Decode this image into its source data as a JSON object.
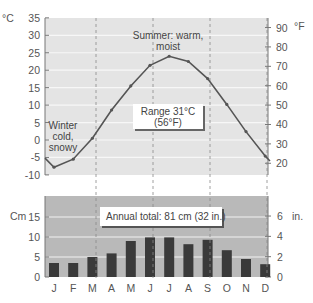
{
  "chart_data": [
    {
      "type": "line",
      "title": "Monthly mean temperature",
      "x": [
        "J",
        "F",
        "M",
        "A",
        "M",
        "J",
        "J",
        "A",
        "S",
        "O",
        "N",
        "D"
      ],
      "series": [
        {
          "name": "Temperature (°C)",
          "values": [
            -7.8,
            -5.5,
            0.5,
            8.6,
            15.5,
            21.4,
            24.0,
            22.5,
            17.6,
            10.2,
            2.4,
            -4.6
          ]
        }
      ],
      "ylabel": "°C",
      "ylabel_right": "°F",
      "ylim": [
        -10,
        35
      ],
      "yticks": [
        -10,
        -5,
        0,
        5,
        10,
        15,
        20,
        25,
        30,
        35
      ],
      "yticks_right": [
        20,
        30,
        40,
        50,
        60,
        70,
        80,
        90
      ],
      "grid": true,
      "annotations": [
        {
          "text": "Summer: warm,",
          "text2": "moist"
        },
        {
          "text": "Winter",
          "text2": "cold,",
          "text3": "snowy"
        },
        {
          "text": "Range 31°C",
          "text2": "(56°F)"
        }
      ]
    },
    {
      "type": "bar",
      "title": "Monthly precipitation",
      "categories": [
        "J",
        "F",
        "M",
        "A",
        "M",
        "J",
        "J",
        "A",
        "S",
        "O",
        "N",
        "D"
      ],
      "values": [
        3.5,
        3.5,
        5.0,
        5.9,
        9.0,
        9.9,
        9.9,
        8.2,
        9.3,
        6.7,
        4.5,
        3.2
      ],
      "ylabel": "Cm",
      "ylabel_right": "in.",
      "ylim": [
        0,
        20
      ],
      "yticks": [
        0,
        5,
        10,
        15
      ],
      "yticks_right": [
        0,
        2,
        4,
        6
      ],
      "grid": true,
      "annotations": [
        {
          "text": "Annual total: 81 cm (32 in.)"
        }
      ]
    }
  ],
  "temp": {
    "unit_left": "°C",
    "unit_right": "°F",
    "ticks_left": [
      "35",
      "30",
      "25",
      "20",
      "15",
      "10",
      "5",
      "0",
      "-5",
      "-10"
    ],
    "ticks_right": [
      "90",
      "80",
      "70",
      "60",
      "50",
      "40",
      "30",
      "20"
    ],
    "summer_1": "Summer: warm,",
    "summer_2": "moist",
    "winter_1": "Winter",
    "winter_2": "cold,",
    "winter_3": "snowy",
    "range_1": "Range 31°C",
    "range_2": "(56°F)"
  },
  "precip": {
    "unit_left": "Cm",
    "unit_right": "in.",
    "ticks_left": [
      "15",
      "10",
      "5",
      "0"
    ],
    "ticks_right": [
      "6",
      "4",
      "2",
      "0"
    ],
    "total": "Annual total: 81 cm (32 in.)"
  },
  "months": [
    "J",
    "F",
    "M",
    "A",
    "M",
    "J",
    "J",
    "A",
    "S",
    "O",
    "N",
    "D"
  ],
  "colors": {
    "temp_bg": "#e4e4e4",
    "precip_bg": "#b9b9b9",
    "line": "#555555",
    "bar": "#3a3a3a",
    "grid": "#f7f7f7"
  }
}
